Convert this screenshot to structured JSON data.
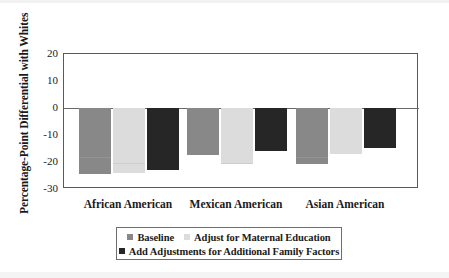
{
  "chart_data": {
    "type": "bar",
    "title": "",
    "xlabel": "",
    "ylabel": "Percentage-Point Differential with Whites",
    "categories": [
      "African American",
      "Mexican American",
      "Asian American"
    ],
    "yticks": [
      "20",
      "10",
      "0",
      "-10",
      "-20",
      "-30"
    ],
    "ytick_values": [
      20,
      10,
      0,
      -10,
      -20,
      -30
    ],
    "ylim": [
      -30,
      20
    ],
    "grid": false,
    "zero_line": true,
    "legend_position": "bottom",
    "series": [
      {
        "name": "Baseline",
        "color": "#888888",
        "values": [
          -24.4,
          -17.4,
          -20.7
        ]
      },
      {
        "name": "Adjust for Maternal Education",
        "color": "#dcdcdc",
        "values": [
          -24.0,
          -20.7,
          -17.0
        ]
      },
      {
        "name": "Add Adjustments for Additional Family Factors",
        "color": "#262626",
        "values": [
          -23.0,
          -15.9,
          -14.8
        ]
      }
    ]
  },
  "legend": {
    "row1": [
      {
        "label": "Baseline",
        "swatch": "legend-swatch-baseline"
      },
      {
        "label": "Adjust for Maternal Education",
        "swatch": "legend-swatch-maternal-education"
      }
    ],
    "row2": [
      {
        "label": "Add Adjustments for Additional Family Factors",
        "swatch": "legend-swatch-family-factors"
      }
    ]
  }
}
